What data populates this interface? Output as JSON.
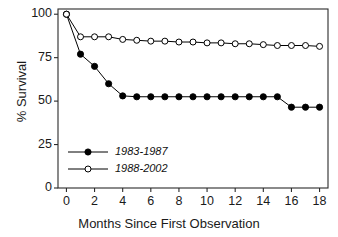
{
  "chart_data": {
    "type": "line",
    "title": "",
    "xlabel": "Months Since First Observation",
    "ylabel": "% Survival",
    "xlim": [
      -0.6,
      18.6
    ],
    "ylim": [
      0,
      103
    ],
    "xticks": [
      0,
      2,
      4,
      6,
      8,
      10,
      12,
      14,
      16,
      18
    ],
    "yticks": [
      0,
      25,
      50,
      75,
      100
    ],
    "xticklabels": [
      "0",
      "2",
      "4",
      "6",
      "8",
      "10",
      "12",
      "14",
      "16",
      "18"
    ],
    "yticklabels": [
      "0",
      "25",
      "50",
      "75",
      "100"
    ],
    "grid": false,
    "legend_position": "lower left",
    "x": [
      0,
      1,
      2,
      3,
      4,
      5,
      6,
      7,
      8,
      9,
      10,
      11,
      12,
      13,
      14,
      15,
      16,
      17,
      18
    ],
    "series": [
      {
        "name": "1983-1987",
        "marker": "filled-circle",
        "color": "#000000",
        "values": [
          100,
          77,
          70,
          60,
          53,
          52.5,
          52.5,
          52.5,
          52.5,
          52.5,
          52.5,
          52.5,
          52.5,
          52.5,
          52.5,
          52.5,
          46.5,
          46.5,
          46.5
        ]
      },
      {
        "name": "1988-2002",
        "marker": "open-circle",
        "color": "#000000",
        "values": [
          100,
          87,
          87,
          87,
          85.5,
          85,
          84.5,
          84.5,
          84,
          84,
          83.5,
          83.5,
          83,
          83,
          82.5,
          82,
          82,
          82,
          81.5
        ]
      }
    ],
    "legend": [
      {
        "label": "1983-1987",
        "marker": "filled-circle"
      },
      {
        "label": "1988-2002",
        "marker": "open-circle"
      }
    ]
  }
}
